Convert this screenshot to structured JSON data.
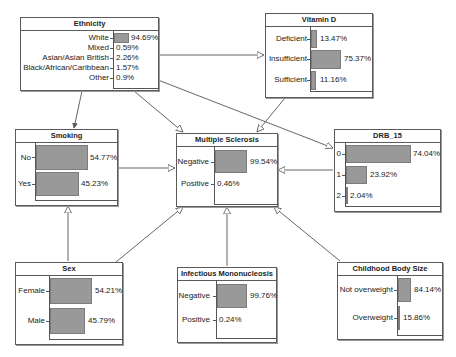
{
  "nodes": {
    "ethnicity": {
      "title": "Ethnicity",
      "states": [
        {
          "label": "White",
          "value": "94.69%",
          "pct": 94.69
        },
        {
          "label": "Mixed",
          "value": "0.59%",
          "pct": 0.59
        },
        {
          "label": "Asian/Asian British",
          "value": "2.26%",
          "pct": 2.26
        },
        {
          "label": "Black/African/Caribbean",
          "value": "1.57%",
          "pct": 1.57
        },
        {
          "label": "Other",
          "value": "0.9%",
          "pct": 0.9
        }
      ]
    },
    "vitamin_d": {
      "title": "Vitamin D",
      "states": [
        {
          "label": "Deficient",
          "value": "13.47%",
          "pct": 13.47
        },
        {
          "label": "Insufficient",
          "value": "75.37%",
          "pct": 75.37
        },
        {
          "label": "Sufficient",
          "value": "11.16%",
          "pct": 11.16
        }
      ]
    },
    "smoking": {
      "title": "Smoking",
      "states": [
        {
          "label": "No",
          "value": "54.77%",
          "pct": 54.77
        },
        {
          "label": "Yes",
          "value": "45.23%",
          "pct": 45.23
        }
      ]
    },
    "multiple_sclerosis": {
      "title": "Multiple Sclerosis",
      "states": [
        {
          "label": "Negative",
          "value": "99.54%",
          "pct": 99.54
        },
        {
          "label": "Positive",
          "value": "0.46%",
          "pct": 0.46
        }
      ]
    },
    "drb_15": {
      "title": "DRB_15",
      "states": [
        {
          "label": "0",
          "value": "74.04%",
          "pct": 74.04
        },
        {
          "label": "1",
          "value": "23.92%",
          "pct": 23.92
        },
        {
          "label": "2",
          "value": "2.04%",
          "pct": 2.04
        }
      ]
    },
    "sex": {
      "title": "Sex",
      "states": [
        {
          "label": "Female",
          "value": "54.21%",
          "pct": 54.21
        },
        {
          "label": "Male",
          "value": "45.79%",
          "pct": 45.79
        }
      ]
    },
    "infectious_mononucleosis": {
      "title": "Infectious Mononucleosis",
      "states": [
        {
          "label": "Negative",
          "value": "99.76%",
          "pct": 99.76
        },
        {
          "label": "Positive",
          "value": "0.24%",
          "pct": 0.24
        }
      ]
    },
    "childhood_body_size": {
      "title": "Childhood Body Size",
      "states": [
        {
          "label": "Not overweight",
          "value": "84.14%",
          "pct": 84.14
        },
        {
          "label": "Overweight",
          "value": "15.86%",
          "pct": 15.86
        }
      ]
    }
  },
  "edges": [
    {
      "from": "Ethnicity",
      "to": "Vitamin D"
    },
    {
      "from": "Ethnicity",
      "to": "Smoking"
    },
    {
      "from": "Ethnicity",
      "to": "Multiple Sclerosis"
    },
    {
      "from": "Ethnicity",
      "to": "DRB_15"
    },
    {
      "from": "Vitamin D",
      "to": "Multiple Sclerosis"
    },
    {
      "from": "Smoking",
      "to": "Multiple Sclerosis"
    },
    {
      "from": "DRB_15",
      "to": "Multiple Sclerosis"
    },
    {
      "from": "Sex",
      "to": "Smoking"
    },
    {
      "from": "Sex",
      "to": "Multiple Sclerosis"
    },
    {
      "from": "Infectious Mononucleosis",
      "to": "Multiple Sclerosis"
    },
    {
      "from": "Childhood Body Size",
      "to": "Multiple Sclerosis"
    }
  ]
}
